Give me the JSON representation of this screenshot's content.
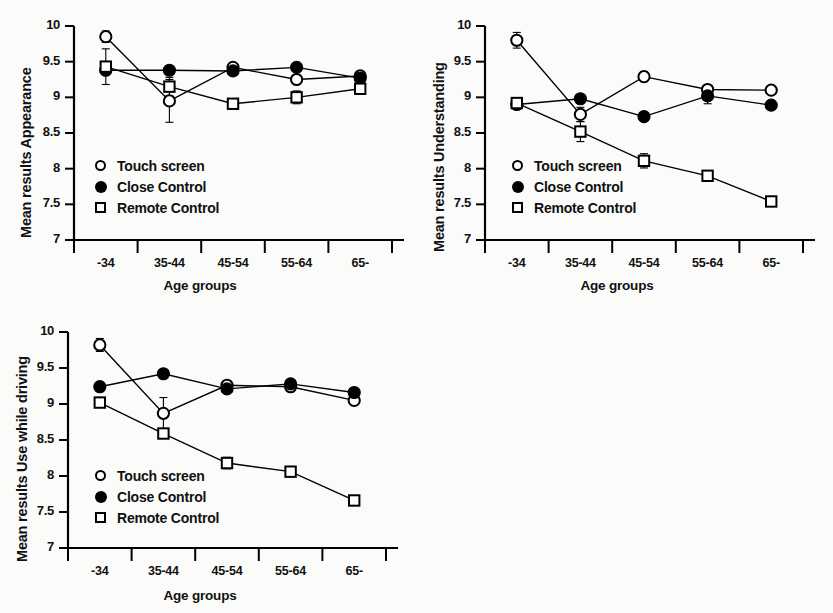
{
  "figure": {
    "xlabel": "Age groups",
    "categories": [
      "-34",
      "35-44",
      "45-54",
      "55-64",
      "65-"
    ],
    "y_ticks": [
      "10",
      "9.5",
      "9",
      "8.5",
      "8",
      "7.5",
      "7"
    ],
    "ylim": [
      7,
      10
    ],
    "legend": [
      {
        "key": "circle-open",
        "label": "Touch screen"
      },
      {
        "key": "circle-filled",
        "label": "Close Control"
      },
      {
        "key": "square-open",
        "label": "Remote Control"
      }
    ]
  },
  "chart_data": [
    {
      "id": "appearance",
      "type": "line",
      "title": "",
      "ylabel": "Mean results Appearance",
      "xlabel": "Age groups",
      "categories": [
        "-34",
        "35-44",
        "45-54",
        "55-64",
        "65-"
      ],
      "ylim": [
        7,
        10
      ],
      "yticks": [
        7,
        7.5,
        8,
        8.5,
        9,
        9.5,
        10
      ],
      "grid": false,
      "legend_position": "lower-left-inside",
      "series": [
        {
          "name": "Touch screen",
          "marker": "circle-open",
          "values": [
            9.85,
            8.95,
            9.42,
            9.25,
            9.3
          ],
          "errors": [
            0.08,
            0.3,
            0.05,
            0.04,
            0.05
          ]
        },
        {
          "name": "Close Control",
          "marker": "circle-filled",
          "values": [
            9.38,
            9.38,
            9.37,
            9.42,
            9.27
          ],
          "errors": [
            0.04,
            0.04,
            0.04,
            0.04,
            0.08
          ]
        },
        {
          "name": "Remote Control",
          "marker": "square-open",
          "values": [
            9.43,
            9.15,
            8.91,
            9.0,
            9.12
          ],
          "errors": [
            0.25,
            0.13,
            0.05,
            0.09,
            0.03
          ]
        }
      ]
    },
    {
      "id": "understanding",
      "type": "line",
      "title": "",
      "ylabel": "Mean results Understanding",
      "xlabel": "Age groups",
      "categories": [
        "-34",
        "35-44",
        "45-54",
        "55-64",
        "65-"
      ],
      "ylim": [
        7,
        10
      ],
      "yticks": [
        7,
        7.5,
        8,
        8.5,
        9,
        9.5,
        10
      ],
      "grid": false,
      "legend_position": "lower-left-inside",
      "series": [
        {
          "name": "Touch screen",
          "marker": "circle-open",
          "values": [
            9.8,
            8.76,
            9.29,
            9.11,
            9.1
          ],
          "errors": [
            0.11,
            0.1,
            0.07,
            0.03,
            0.02
          ]
        },
        {
          "name": "Close Control",
          "marker": "circle-filled",
          "values": [
            8.9,
            8.98,
            8.73,
            9.02,
            8.89
          ],
          "errors": [
            0.03,
            0.03,
            0.03,
            0.11,
            0.06
          ]
        },
        {
          "name": "Remote Control",
          "marker": "square-open",
          "values": [
            8.92,
            8.52,
            8.11,
            7.9,
            7.54
          ],
          "errors": [
            0.03,
            0.14,
            0.1,
            0.03,
            0.02
          ]
        }
      ]
    },
    {
      "id": "driving",
      "type": "line",
      "title": "",
      "ylabel": "Mean results Use while driving",
      "xlabel": "Age groups",
      "categories": [
        "-34",
        "35-44",
        "45-54",
        "55-64",
        "65-"
      ],
      "ylim": [
        7,
        10
      ],
      "yticks": [
        7,
        7.5,
        8,
        8.5,
        9,
        9.5,
        10
      ],
      "grid": false,
      "legend_position": "lower-left-inside",
      "series": [
        {
          "name": "Touch screen",
          "marker": "circle-open",
          "values": [
            9.82,
            8.87,
            9.26,
            9.24,
            9.05
          ],
          "errors": [
            0.09,
            0.22,
            0.06,
            0.04,
            0.06
          ]
        },
        {
          "name": "Close Control",
          "marker": "circle-filled",
          "values": [
            9.24,
            9.42,
            9.21,
            9.28,
            9.16
          ],
          "errors": [
            0.03,
            0.03,
            0.03,
            0.03,
            0.03
          ]
        },
        {
          "name": "Remote Control",
          "marker": "square-open",
          "values": [
            9.02,
            8.59,
            8.18,
            8.06,
            7.66
          ],
          "errors": [
            0.03,
            0.03,
            0.08,
            0.03,
            0.03
          ]
        }
      ]
    }
  ]
}
